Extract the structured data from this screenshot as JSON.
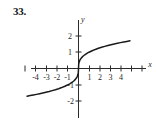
{
  "figure": {
    "problem_number": "33."
  },
  "chart_data": {
    "type": "line",
    "title": "",
    "subtitle": "",
    "xlabel": "x",
    "ylabel": "y",
    "xlim": [
      -5.2,
      5.2
    ],
    "ylim": [
      -2.6,
      2.6
    ],
    "grid": false,
    "legend": null,
    "annotations": [],
    "x_tick_labels": [
      "-4",
      "-3",
      "-2",
      "-1",
      "1",
      "2",
      "3",
      "4"
    ],
    "x_tick_values": [
      -4,
      -3,
      -2,
      -1,
      1,
      2,
      3,
      4
    ],
    "y_tick_labels": [
      "2",
      "1",
      "-1",
      "-2"
    ],
    "y_tick_values": [
      2,
      1,
      -1,
      -2
    ],
    "series": [
      {
        "name": "cube-root curve",
        "color": "#1a1a1a",
        "x": [
          -4.9,
          -4.6,
          -4.3,
          -4.0,
          -3.7,
          -3.4,
          -3.1,
          -2.8,
          -2.5,
          -2.2,
          -1.9,
          -1.6,
          -1.3,
          -1.0,
          -0.8,
          -0.6,
          -0.45,
          -0.3,
          -0.2,
          -0.12,
          -0.06,
          -0.02,
          0,
          0.02,
          0.06,
          0.12,
          0.2,
          0.3,
          0.45,
          0.6,
          0.8,
          1.0,
          1.3,
          1.6,
          1.9,
          2.2,
          2.5,
          2.8,
          3.1,
          3.4,
          3.7,
          4.0,
          4.3,
          4.6,
          4.9
        ],
        "y": [
          -1.7,
          -1.663,
          -1.626,
          -1.587,
          -1.546,
          -1.504,
          -1.459,
          -1.412,
          -1.357,
          -1.301,
          -1.239,
          -1.17,
          -1.091,
          -1.0,
          -0.928,
          -0.843,
          -0.766,
          -0.669,
          -0.585,
          -0.493,
          -0.391,
          -0.271,
          0,
          0.271,
          0.391,
          0.493,
          0.585,
          0.669,
          0.766,
          0.843,
          0.928,
          1.0,
          1.091,
          1.17,
          1.239,
          1.301,
          1.357,
          1.412,
          1.459,
          1.504,
          1.546,
          1.587,
          1.626,
          1.663,
          1.7
        ]
      }
    ]
  }
}
